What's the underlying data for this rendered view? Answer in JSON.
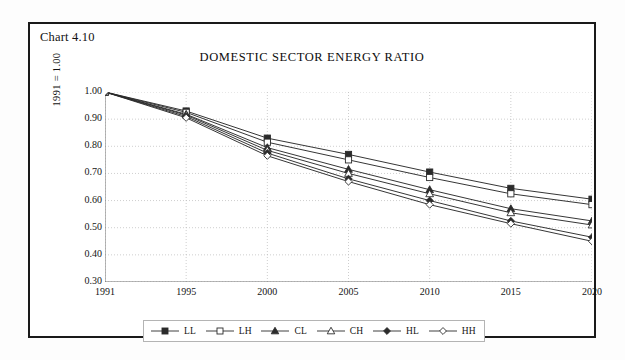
{
  "chart_number": "Chart 4.10",
  "chart_data": {
    "type": "line",
    "title": "DOMESTIC SECTOR ENERGY RATIO",
    "xlabel": "",
    "ylabel": "1991 = 1.00",
    "categories": [
      "1991",
      "1995",
      "2000",
      "2005",
      "2010",
      "2015",
      "2020"
    ],
    "ylim": [
      0.3,
      1.0
    ],
    "ytick_labels": [
      "1.00",
      "0.90",
      "0.80",
      "0.70",
      "0.60",
      "0.50",
      "0.40",
      "0.30"
    ],
    "ytick_values": [
      1.0,
      0.9,
      0.8,
      0.7,
      0.6,
      0.5,
      0.4,
      0.3
    ],
    "grid": true,
    "legend_position": "bottom",
    "series": [
      {
        "name": "LL",
        "marker": "filled-square",
        "values": [
          1.0,
          0.93,
          0.83,
          0.77,
          0.705,
          0.645,
          0.605
        ]
      },
      {
        "name": "LH",
        "marker": "open-square",
        "values": [
          1.0,
          0.925,
          0.815,
          0.75,
          0.685,
          0.625,
          0.585
        ]
      },
      {
        "name": "CL",
        "marker": "filled-triangle",
        "values": [
          1.0,
          0.918,
          0.795,
          0.715,
          0.64,
          0.57,
          0.525
        ]
      },
      {
        "name": "CH",
        "marker": "open-triangle",
        "values": [
          1.0,
          0.915,
          0.785,
          0.7,
          0.625,
          0.555,
          0.51
        ]
      },
      {
        "name": "HL",
        "marker": "filled-diamond",
        "values": [
          1.0,
          0.91,
          0.775,
          0.68,
          0.6,
          0.525,
          0.465
        ]
      },
      {
        "name": "HH",
        "marker": "open-diamond",
        "values": [
          1.0,
          0.905,
          0.765,
          0.67,
          0.585,
          0.515,
          0.45
        ]
      }
    ]
  },
  "colors": {
    "line": "#2b2b2b",
    "grid": "#b9b9b9",
    "axis": "#6f6f6f",
    "frame": "#1a1a1a",
    "text": "#111111"
  }
}
